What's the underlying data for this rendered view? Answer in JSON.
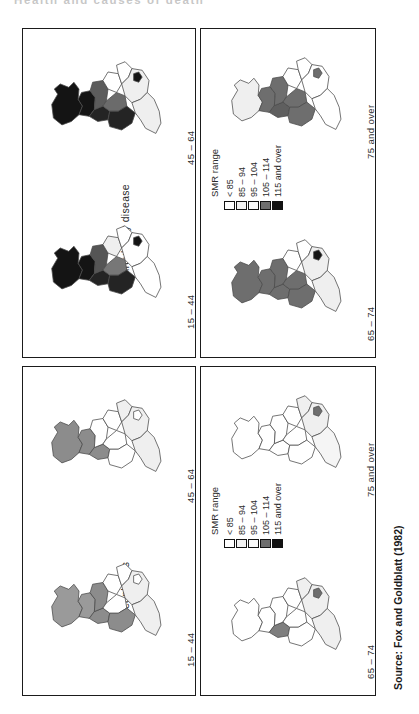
{
  "running_head": "Health and causes of death",
  "figure": {
    "caption": "Figure 3.9 (contd)",
    "source": "Source: Fox and Goldblatt (1982)"
  },
  "legend": {
    "title": "SMR range",
    "items": [
      {
        "label": "< 85",
        "color": "#ffffff"
      },
      {
        "label": "85 – 94",
        "color": "#f2f2f2"
      },
      {
        "label": "95 – 104",
        "color": "#fafafa"
      },
      {
        "label": "105 – 114",
        "color": "#6e6e6e"
      },
      {
        "label": "115 and over",
        "color": "#121212"
      }
    ]
  },
  "panels": [
    {
      "id": "neoplasms",
      "title": "Neoplasms",
      "maps": [
        {
          "age": "15 – 44",
          "regions": {
            "north": "#9a9a9a",
            "yorks": "#8c8c8c",
            "northwest": "#8c8c8c",
            "eastmid": "#ffffff",
            "westmid": "#ffffff",
            "eastanglia": "#ffffff",
            "southeast": "#efefef",
            "greaterlondon": "#ffffff",
            "southwest": "#efefef",
            "wales": "#8c8c8c",
            "scotland": "#9a9a9a"
          }
        },
        {
          "age": "45 – 64",
          "regions": {
            "north": "#8c8c8c",
            "yorks": "#ffffff",
            "northwest": "#8c8c8c",
            "eastmid": "#ffffff",
            "westmid": "#ffffff",
            "eastanglia": "#efefef",
            "southeast": "#efefef",
            "greaterlondon": "#ffffff",
            "southwest": "#efefef",
            "wales": "#ffffff",
            "scotland": "#8c8c8c"
          }
        },
        {
          "age": "65 – 74",
          "regions": {
            "north": "#ffffff",
            "yorks": "#ffffff",
            "northwest": "#7e7e7e",
            "eastmid": "#ffffff",
            "westmid": "#ffffff",
            "eastanglia": "#efefef",
            "southeast": "#efefef",
            "greaterlondon": "#6e6e6e",
            "southwest": "#efefef",
            "wales": "#ffffff",
            "scotland": "#ffffff"
          }
        },
        {
          "age": "75 and over",
          "regions": {
            "north": "#ffffff",
            "yorks": "#ffffff",
            "northwest": "#ffffff",
            "eastmid": "#ffffff",
            "westmid": "#ffffff",
            "eastanglia": "#efefef",
            "southeast": "#efefef",
            "greaterlondon": "#6e6e6e",
            "southwest": "#f5f5f5",
            "wales": "#ffffff",
            "scotland": "#ffffff"
          }
        }
      ]
    },
    {
      "id": "circulatory",
      "title": "Circulatory disease",
      "maps": [
        {
          "age": "15 – 44",
          "regions": {
            "north": "#141414",
            "yorks": "#555555",
            "northwest": "#242424",
            "eastmid": "#efefef",
            "westmid": "#777777",
            "eastanglia": "#ffffff",
            "southeast": "#ffffff",
            "greaterlondon": "#141414",
            "southwest": "#ffffff",
            "wales": "#242424",
            "scotland": "#141414"
          }
        },
        {
          "age": "45 – 64",
          "regions": {
            "north": "#141414",
            "yorks": "#5c5c5c",
            "northwest": "#242424",
            "eastmid": "#ffffff",
            "westmid": "#6b6b6b",
            "eastanglia": "#ffffff",
            "southeast": "#efefef",
            "greaterlondon": "#141414",
            "southwest": "#efefef",
            "wales": "#242424",
            "scotland": "#141414"
          }
        },
        {
          "age": "65 – 74",
          "regions": {
            "north": "#6e6e6e",
            "yorks": "#6e6e6e",
            "northwest": "#6e6e6e",
            "eastmid": "#ffffff",
            "westmid": "#6e6e6e",
            "eastanglia": "#ffffff",
            "southeast": "#efefef",
            "greaterlondon": "#141414",
            "southwest": "#efefef",
            "wales": "#6e6e6e",
            "scotland": "#6e6e6e"
          }
        },
        {
          "age": "75 and over",
          "regions": {
            "north": "#6e6e6e",
            "yorks": "#6e6e6e",
            "northwest": "#5f5f5f",
            "eastmid": "#ffffff",
            "westmid": "#6e6e6e",
            "eastanglia": "#ffffff",
            "southeast": "#ffffff",
            "greaterlondon": "#6e6e6e",
            "southwest": "#ffffff",
            "wales": "#6e6e6e",
            "scotland": "#efefef"
          }
        }
      ]
    }
  ]
}
